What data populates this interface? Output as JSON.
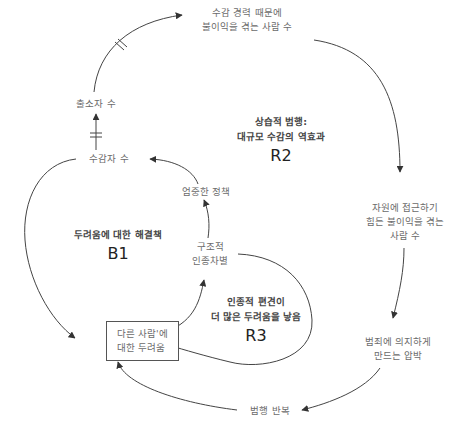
{
  "diagram": {
    "type": "causal-loop-diagram",
    "colors": {
      "line": "#444444",
      "node_text": "#6b6b6b",
      "loop_title": "#444444",
      "loop_code": "#222222",
      "box_border": "#555555"
    },
    "nodes": {
      "incarcerated_disadvantaged": {
        "lines": [
          "수감 경력 때문에",
          "불이익을 겪는 사람 수"
        ]
      },
      "released": {
        "lines": [
          "출소자 수"
        ]
      },
      "incarcerated": {
        "lines": [
          "수감자 수"
        ]
      },
      "strict_policy": {
        "lines": [
          "엄중한 정책"
        ]
      },
      "structural_racism": {
        "lines": [
          "구조적",
          "인종차별"
        ]
      },
      "resource_access": {
        "lines": [
          "자원에 접근하기",
          "힘든 불이익을 겪는",
          "사람 수"
        ]
      },
      "fear_of_others": {
        "lines": [
          "다른 사람'에",
          "대한 두려움"
        ]
      },
      "crime_pressure": {
        "lines": [
          "범죄에 의지하게",
          "만드는 압박"
        ]
      },
      "repeat_offense": {
        "lines": [
          "범행 반복"
        ]
      }
    },
    "loops": {
      "r2": {
        "title_lines": [
          "상습적 범행:",
          "대규모 수감의 역효과"
        ],
        "code": "R2"
      },
      "b1": {
        "title_lines": [
          "두려움에 대한 해결책"
        ],
        "code": "B1"
      },
      "r3": {
        "title_lines": [
          "인종적 편견이",
          "더 많은 두려움을 낳음"
        ],
        "code": "R3"
      }
    },
    "links": [
      {
        "from": "released",
        "to": "incarcerated_disadvantaged",
        "delay": true
      },
      {
        "from": "incarcerated",
        "to": "released",
        "delay": true
      },
      {
        "from": "incarcerated_disadvantaged",
        "to": "resource_access",
        "delay": false
      },
      {
        "from": "resource_access",
        "to": "crime_pressure",
        "delay": false
      },
      {
        "from": "crime_pressure",
        "to": "repeat_offense",
        "delay": false
      },
      {
        "from": "repeat_offense",
        "to": "fear_of_others",
        "delay": false
      },
      {
        "from": "incarcerated",
        "to": "fear_of_others",
        "delay": false
      },
      {
        "from": "strict_policy",
        "to": "incarcerated",
        "delay": false
      },
      {
        "from": "structural_racism",
        "to": "strict_policy",
        "delay": false
      },
      {
        "from": "fear_of_others",
        "to": "structural_racism",
        "delay": false
      },
      {
        "from": "structural_racism",
        "to": "fear_of_others",
        "delay": false
      }
    ]
  }
}
